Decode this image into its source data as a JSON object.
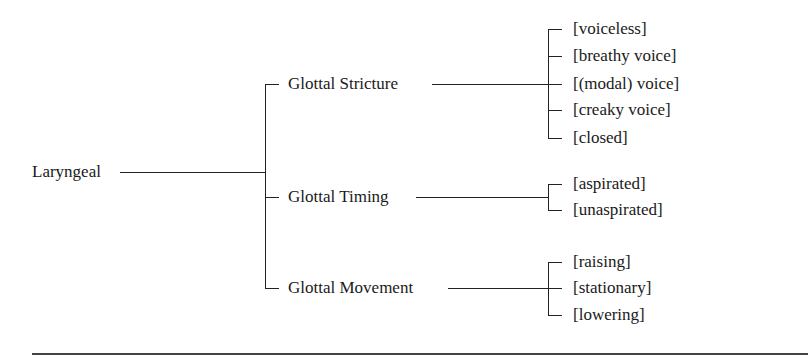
{
  "diagram": {
    "root": "Laryngeal",
    "branches": [
      {
        "label": "Glottal Stricture",
        "values": [
          "[voiceless]",
          "[breathy voice]",
          "[(modal) voice]",
          "[creaky voice]",
          "[closed]"
        ]
      },
      {
        "label": "Glottal Timing",
        "values": [
          "[aspirated]",
          "[unaspirated]"
        ]
      },
      {
        "label": "Glottal Movement",
        "values": [
          "[raising]",
          "[stationary]",
          "[lowering]"
        ]
      }
    ]
  }
}
